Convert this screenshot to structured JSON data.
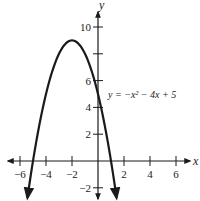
{
  "chart_data": {
    "type": "line",
    "title": "",
    "xlabel": "x",
    "ylabel": "y",
    "equation_label": "y = −x² − 4x + 5",
    "function": "y = -x^2 - 4x + 5",
    "xlim": [
      -7,
      7
    ],
    "ylim": [
      -3,
      11.5
    ],
    "x_ticks": [
      -6,
      -4,
      -2,
      2,
      4,
      6
    ],
    "x_tick_labels": [
      "−6",
      "−4",
      "−2",
      "2",
      "4",
      "6"
    ],
    "y_ticks": [
      -2,
      2,
      4,
      6,
      8,
      10
    ],
    "y_tick_labels": [
      "−2",
      "",
      "",
      "6",
      "",
      "10"
    ],
    "y_tick_labels_visible": {
      "10": "10",
      "6": "6",
      "4": "4",
      "2": "2",
      "-2": "−2"
    },
    "grid": false,
    "series": [
      {
        "name": "y = −x² − 4x + 5",
        "x": [
          -6.3,
          -6,
          -5,
          -4,
          -3,
          -2,
          -1,
          0,
          1,
          1.3
        ],
        "values": [
          -9.5,
          -7,
          0,
          5,
          8,
          9,
          8,
          5,
          0,
          -1.9
        ]
      }
    ],
    "key_points": {
      "vertex": [
        -2,
        9
      ],
      "y_intercept": [
        0,
        5
      ],
      "x_intercepts": [
        [
          -5,
          0
        ],
        [
          1,
          0
        ]
      ]
    },
    "color": "#1a1a1a"
  }
}
